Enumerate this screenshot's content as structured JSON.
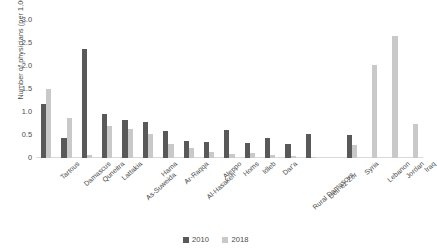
{
  "chart_data": {
    "type": "bar",
    "title": "",
    "xlabel": "",
    "ylabel": "Number of physicians (per 1,000 persons)",
    "ylim": [
      0,
      3.0
    ],
    "yticks": [
      "0",
      "0.5",
      "1.0",
      "1.5",
      "2.0",
      "2.5",
      "3.0"
    ],
    "grid": false,
    "legend_position": "bottom",
    "categories": [
      "Tartous",
      "Damascus",
      "Quneitra",
      "Lattakia",
      "As-Suweida",
      "Hama",
      "Ar-Raqqa",
      "Al-Hasakeh",
      "Aleppo",
      "Homs",
      "Idleb",
      "Dar'a",
      "Rural Damascus",
      "Deir-ez-Zor",
      "",
      "Syria",
      "Lebanon",
      "Jordan",
      "Iraq"
    ],
    "series": [
      {
        "name": "2010",
        "color": "#595959",
        "values": [
          1.17,
          0.43,
          2.37,
          0.96,
          0.82,
          0.78,
          0.58,
          0.38,
          0.35,
          0.6,
          0.33,
          0.43,
          0.3,
          0.52,
          null,
          0.5,
          null,
          null,
          null
        ]
      },
      {
        "name": "2018",
        "color": "#c9c9c9",
        "values": [
          1.5,
          0.88,
          0.06,
          0.7,
          0.62,
          0.53,
          0.31,
          0.22,
          0.14,
          0.08,
          0.1,
          0.07,
          0.05,
          0.02,
          null,
          0.28,
          2.02,
          2.65,
          0.75
        ]
      }
    ]
  },
  "legend": {
    "items": [
      {
        "label": "2010"
      },
      {
        "label": "2018"
      }
    ]
  }
}
